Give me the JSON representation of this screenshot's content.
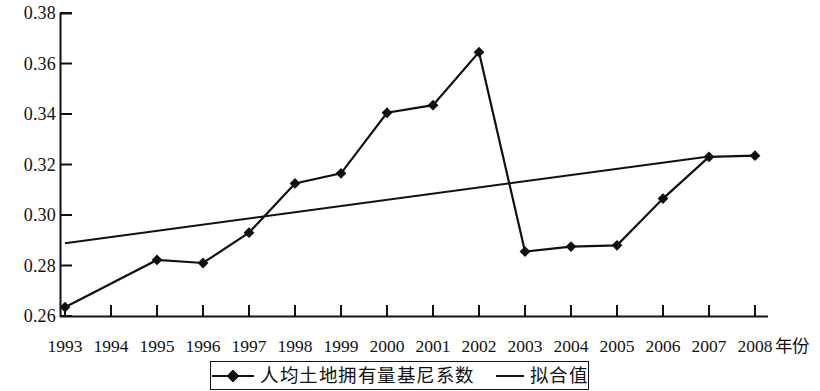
{
  "chart_data": {
    "type": "line",
    "title": "",
    "xlabel": "年份",
    "ylabel": "",
    "x": [
      1993,
      1994,
      1995,
      1996,
      1997,
      1998,
      1999,
      2000,
      2001,
      2002,
      2003,
      2004,
      2005,
      2006,
      2007,
      2008
    ],
    "categories": [
      "1993",
      "1994",
      "1995",
      "1996",
      "1997",
      "1998",
      "1999",
      "2000",
      "2001",
      "2002",
      "2003",
      "2004",
      "2005",
      "2006",
      "2007",
      "2008"
    ],
    "ylim": [
      0.26,
      0.38
    ],
    "xlim": [
      1993,
      2008
    ],
    "yticks": [
      0.26,
      0.28,
      0.3,
      0.32,
      0.34,
      0.36,
      0.38
    ],
    "ytick_labels": [
      "0.26",
      "0.28",
      "0.30",
      "0.32",
      "0.34",
      "0.36",
      "0.38"
    ],
    "grid": false,
    "legend_position": "bottom-center",
    "series": [
      {
        "name": "人均土地拥有量基尼系数",
        "type": "line",
        "marker": "diamond",
        "color": "#111111",
        "values": [
          0.2635,
          null,
          0.2822,
          0.281,
          0.293,
          0.3125,
          0.3165,
          0.3405,
          0.3435,
          0.3645,
          0.2855,
          0.2875,
          0.288,
          0.3065,
          0.323,
          0.3235
        ],
        "marker_years": [
          1993,
          1995,
          1996,
          1997,
          1998,
          1999,
          2000,
          2001,
          2002,
          2003,
          2004,
          2005,
          2006,
          2007,
          2008
        ]
      },
      {
        "name": "拟合值",
        "type": "line",
        "marker": "none",
        "color": "#111111",
        "x_start": 1993,
        "x_end": 2007,
        "y_start": 0.2888,
        "y_end": 0.3232,
        "values": [
          0.2888,
          0.2913,
          0.2937,
          0.2962,
          0.2986,
          0.3011,
          0.3035,
          0.306,
          0.3085,
          0.3109,
          0.3134,
          0.3158,
          0.3183,
          0.3207,
          0.3232,
          null
        ]
      }
    ]
  },
  "axes": {
    "y_tick_labels": [
      "0.38",
      "0.36",
      "0.34",
      "0.32",
      "0.30",
      "0.28",
      "0.26"
    ],
    "x_tick_labels": [
      "1993",
      "1994",
      "1995",
      "1996",
      "1997",
      "1998",
      "1999",
      "2000",
      "2001",
      "2002",
      "2003",
      "2004",
      "2005",
      "2006",
      "2007",
      "2008"
    ],
    "x_axis_title": "年份"
  },
  "legend": {
    "entries": [
      {
        "label": "人均土地拥有量基尼系数",
        "swatch": "line-with-diamond-marker"
      },
      {
        "label": "拟合值",
        "swatch": "plain-line"
      }
    ]
  }
}
